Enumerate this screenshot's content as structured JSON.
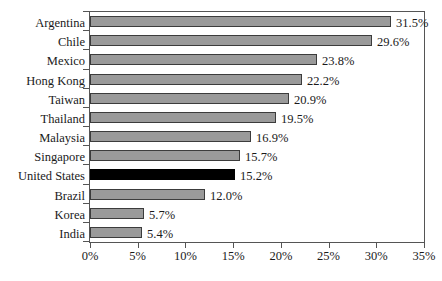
{
  "chart_data": {
    "type": "bar",
    "orientation": "horizontal",
    "title": "",
    "subtitle": "",
    "xlabel": "",
    "ylabel": "",
    "xlim": [
      0,
      35
    ],
    "grid": false,
    "legend": null,
    "value_suffix": "%",
    "xticks": [
      "0%",
      "5%",
      "10%",
      "15%",
      "20%",
      "25%",
      "30%",
      "35%"
    ],
    "xtick_values": [
      0,
      5,
      10,
      15,
      20,
      25,
      30,
      35
    ],
    "categories": [
      "Argentina",
      "Chile",
      "Mexico",
      "Hong Kong",
      "Taiwan",
      "Thailand",
      "Malaysia",
      "Singapore",
      "United States",
      "Brazil",
      "Korea",
      "India"
    ],
    "values": [
      31.5,
      29.6,
      23.8,
      22.2,
      20.9,
      19.5,
      16.9,
      15.7,
      15.2,
      12.0,
      5.7,
      5.4
    ],
    "data_labels": [
      "31.5%",
      "29.6%",
      "23.8%",
      "22.2%",
      "20.9%",
      "19.5%",
      "16.9%",
      "15.7%",
      "15.2%",
      "12.0%",
      "5.7%",
      "5.4%"
    ],
    "highlight_index": 8,
    "colors": {
      "bar_fill": "#9a9a9a",
      "bar_border": "#3c3c3c",
      "highlight_fill": "#000000",
      "axis": "#555555",
      "text": "#1a1a1a",
      "background": "#ffffff"
    }
  }
}
